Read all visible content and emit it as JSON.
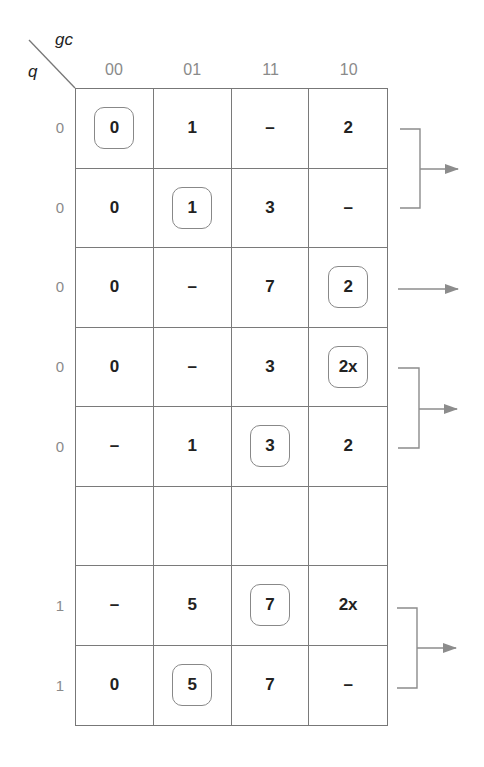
{
  "diagram": {
    "corner": {
      "column_variables": "gc",
      "row_variable": "q"
    },
    "column_headers": [
      "00",
      "01",
      "11",
      "10"
    ],
    "rows": [
      {
        "label": "0",
        "cells": [
          {
            "v": "0",
            "boxed": true
          },
          {
            "v": "1",
            "boxed": false
          },
          {
            "v": "–",
            "boxed": false
          },
          {
            "v": "2",
            "boxed": false
          }
        ]
      },
      {
        "label": "0",
        "cells": [
          {
            "v": "0",
            "boxed": false
          },
          {
            "v": "1",
            "boxed": true
          },
          {
            "v": "3",
            "boxed": false
          },
          {
            "v": "–",
            "boxed": false
          }
        ]
      },
      {
        "label": "0",
        "cells": [
          {
            "v": "0",
            "boxed": false
          },
          {
            "v": "–",
            "boxed": false
          },
          {
            "v": "7",
            "boxed": false
          },
          {
            "v": "2",
            "boxed": true
          }
        ]
      },
      {
        "label": "0",
        "cells": [
          {
            "v": "0",
            "boxed": false
          },
          {
            "v": "–",
            "boxed": false
          },
          {
            "v": "3",
            "boxed": false
          },
          {
            "v": "2x",
            "boxed": true
          }
        ]
      },
      {
        "label": "0",
        "cells": [
          {
            "v": "–",
            "boxed": false
          },
          {
            "v": "1",
            "boxed": false
          },
          {
            "v": "3",
            "boxed": true
          },
          {
            "v": "2",
            "boxed": false
          }
        ]
      },
      {
        "label": "",
        "cells": [
          {
            "v": "",
            "boxed": false
          },
          {
            "v": "",
            "boxed": false
          },
          {
            "v": "",
            "boxed": false
          },
          {
            "v": "",
            "boxed": false
          }
        ]
      },
      {
        "label": "1",
        "cells": [
          {
            "v": "–",
            "boxed": false
          },
          {
            "v": "5",
            "boxed": false
          },
          {
            "v": "7",
            "boxed": true
          },
          {
            "v": "2x",
            "boxed": false
          }
        ]
      },
      {
        "label": "1",
        "cells": [
          {
            "v": "0",
            "boxed": false
          },
          {
            "v": "5",
            "boxed": true
          },
          {
            "v": "7",
            "boxed": false
          },
          {
            "v": "–",
            "boxed": false
          }
        ]
      }
    ],
    "connectors": [
      {
        "type": "bracket",
        "rows": [
          0,
          1
        ]
      },
      {
        "type": "arrow",
        "rows": [
          2
        ]
      },
      {
        "type": "bracket",
        "rows": [
          3,
          4
        ]
      },
      {
        "type": "bracket",
        "rows": [
          6,
          7
        ]
      }
    ],
    "colors": {
      "line": "#777777",
      "text": "#222222",
      "label": "#8a8a8a",
      "connector": "#8c8c8c"
    }
  }
}
